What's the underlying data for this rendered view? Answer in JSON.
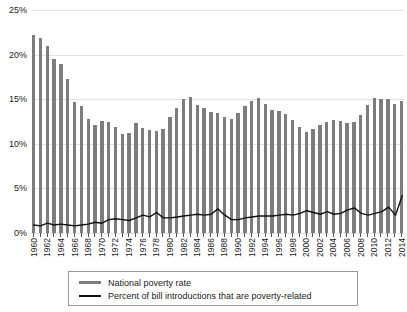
{
  "chart_data": {
    "type": "bar",
    "title": "",
    "xlabel": "",
    "ylabel": "",
    "ylim": [
      0,
      25
    ],
    "ytick_labels": [
      "0%",
      "5%",
      "10%",
      "15%",
      "20%",
      "25%"
    ],
    "ytick_values": [
      0,
      5,
      10,
      15,
      20,
      25
    ],
    "grid": true,
    "legend_position": "bottom",
    "x": [
      1960,
      1961,
      1962,
      1963,
      1964,
      1965,
      1966,
      1967,
      1968,
      1969,
      1970,
      1971,
      1972,
      1973,
      1974,
      1975,
      1976,
      1977,
      1978,
      1979,
      1980,
      1981,
      1982,
      1983,
      1984,
      1985,
      1986,
      1987,
      1988,
      1989,
      1990,
      1991,
      1992,
      1993,
      1994,
      1995,
      1996,
      1997,
      1998,
      1999,
      2000,
      2001,
      2002,
      2003,
      2004,
      2005,
      2006,
      2007,
      2008,
      2009,
      2010,
      2011,
      2012,
      2013,
      2014
    ],
    "categories": [
      "1960",
      "1961",
      "1962",
      "1963",
      "1964",
      "1965",
      "1966",
      "1967",
      "1968",
      "1969",
      "1970",
      "1971",
      "1972",
      "1973",
      "1974",
      "1975",
      "1976",
      "1977",
      "1978",
      "1979",
      "1980",
      "1981",
      "1982",
      "1983",
      "1984",
      "1985",
      "1986",
      "1987",
      "1988",
      "1989",
      "1990",
      "1991",
      "1992",
      "1993",
      "1994",
      "1995",
      "1996",
      "1997",
      "1998",
      "1999",
      "2000",
      "2001",
      "2002",
      "2003",
      "2004",
      "2005",
      "2006",
      "2007",
      "2008",
      "2009",
      "2010",
      "2011",
      "2012",
      "2013",
      "2014"
    ],
    "xtick_labels": [
      "1960",
      "1962",
      "1964",
      "1966",
      "1968",
      "1970",
      "1972",
      "1974",
      "1976",
      "1978",
      "1980",
      "1982",
      "1984",
      "1986",
      "1988",
      "1990",
      "1992",
      "1994",
      "1996",
      "1998",
      "2000",
      "2002",
      "2004",
      "2006",
      "2008",
      "2010",
      "2012",
      "2014"
    ],
    "series": [
      {
        "name": "National poverty rate",
        "type": "bar",
        "color": "#7d7d7d",
        "values": [
          22.2,
          21.9,
          21.0,
          19.5,
          19.0,
          17.3,
          14.7,
          14.2,
          12.8,
          12.1,
          12.6,
          12.5,
          11.9,
          11.1,
          11.2,
          12.3,
          11.8,
          11.6,
          11.4,
          11.7,
          13.0,
          14.0,
          15.0,
          15.2,
          14.4,
          14.0,
          13.6,
          13.4,
          13.0,
          12.8,
          13.5,
          14.2,
          14.8,
          15.1,
          14.5,
          13.8,
          13.7,
          13.3,
          12.7,
          11.9,
          11.3,
          11.7,
          12.1,
          12.5,
          12.7,
          12.6,
          12.3,
          12.5,
          13.2,
          14.3,
          15.1,
          15.0,
          15.0,
          14.5,
          14.8
        ]
      },
      {
        "name": "Percent of bill introductions that are poverty-related",
        "type": "line",
        "color": "#111111",
        "values": [
          0.9,
          0.8,
          1.1,
          0.9,
          1.0,
          0.9,
          0.8,
          0.9,
          1.0,
          1.2,
          1.1,
          1.5,
          1.6,
          1.5,
          1.4,
          1.7,
          2.0,
          1.8,
          2.3,
          1.7,
          1.7,
          1.8,
          1.9,
          2.0,
          2.1,
          2.0,
          2.1,
          2.7,
          2.0,
          1.5,
          1.5,
          1.7,
          1.8,
          1.9,
          1.9,
          1.9,
          2.0,
          2.1,
          2.0,
          2.2,
          2.5,
          2.3,
          2.1,
          2.4,
          2.1,
          2.2,
          2.6,
          2.8,
          2.2,
          2.0,
          2.2,
          2.4,
          2.9,
          2.0,
          4.2
        ]
      }
    ]
  },
  "legend": {
    "items": [
      {
        "label": "National poverty rate"
      },
      {
        "label": "Percent of bill introductions that are poverty-related"
      }
    ]
  }
}
